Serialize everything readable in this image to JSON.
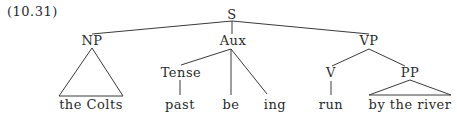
{
  "example_number": "(10.31)",
  "tree": {
    "root": "S",
    "nodes": {
      "S": "S",
      "NP": "NP",
      "Aux": "Aux",
      "VP": "VP",
      "Tense": "Tense",
      "V": "V",
      "PP": "PP"
    },
    "leaves": {
      "np_leaf": "the Colts",
      "past": "past",
      "be": "be",
      "ing": "ing",
      "run": "run",
      "pp_leaf": "by the river"
    },
    "structure": [
      {
        "parent": "S",
        "children": [
          "NP",
          "Aux",
          "VP"
        ]
      },
      {
        "parent": "NP",
        "children": [
          "the Colts"
        ],
        "triangle": true
      },
      {
        "parent": "Aux",
        "children": [
          "Tense",
          "be",
          "ing"
        ]
      },
      {
        "parent": "Tense",
        "children": [
          "past"
        ]
      },
      {
        "parent": "VP",
        "children": [
          "V",
          "PP"
        ]
      },
      {
        "parent": "V",
        "children": [
          "run"
        ]
      },
      {
        "parent": "PP",
        "children": [
          "by the river"
        ],
        "triangle": true
      }
    ]
  }
}
